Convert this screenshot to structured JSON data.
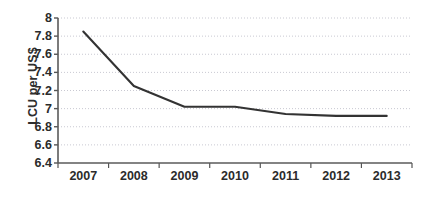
{
  "chart_data": {
    "type": "line",
    "title": "",
    "subtitle": "",
    "xlabel": "",
    "ylabel": "LCU per US$",
    "categories": [
      "2007",
      "2008",
      "2009",
      "2010",
      "2011",
      "2012",
      "2013"
    ],
    "values": [
      7.85,
      7.25,
      7.02,
      7.02,
      6.94,
      6.92,
      6.92
    ],
    "series": [
      {
        "name": "LCU per US$",
        "values": [
          7.85,
          7.25,
          7.02,
          7.02,
          6.94,
          6.92,
          6.92
        ]
      }
    ],
    "ylim": [
      6.4,
      8.0
    ],
    "y_ticks": [
      "6.4",
      "6.6",
      "6.8",
      "7",
      "7.2",
      "7.4",
      "7.6",
      "7.8",
      "8"
    ],
    "y_tick_values": [
      6.4,
      6.6,
      6.8,
      7.0,
      7.2,
      7.4,
      7.6,
      7.8,
      8.0
    ],
    "grid": true,
    "grid_style": "dotted",
    "legend": false,
    "legend_position": "none",
    "line_color": "#333333",
    "grid_color": "#c9c9d2",
    "axis_color": "#555555",
    "background_color": "#ffffff",
    "annotations": []
  }
}
